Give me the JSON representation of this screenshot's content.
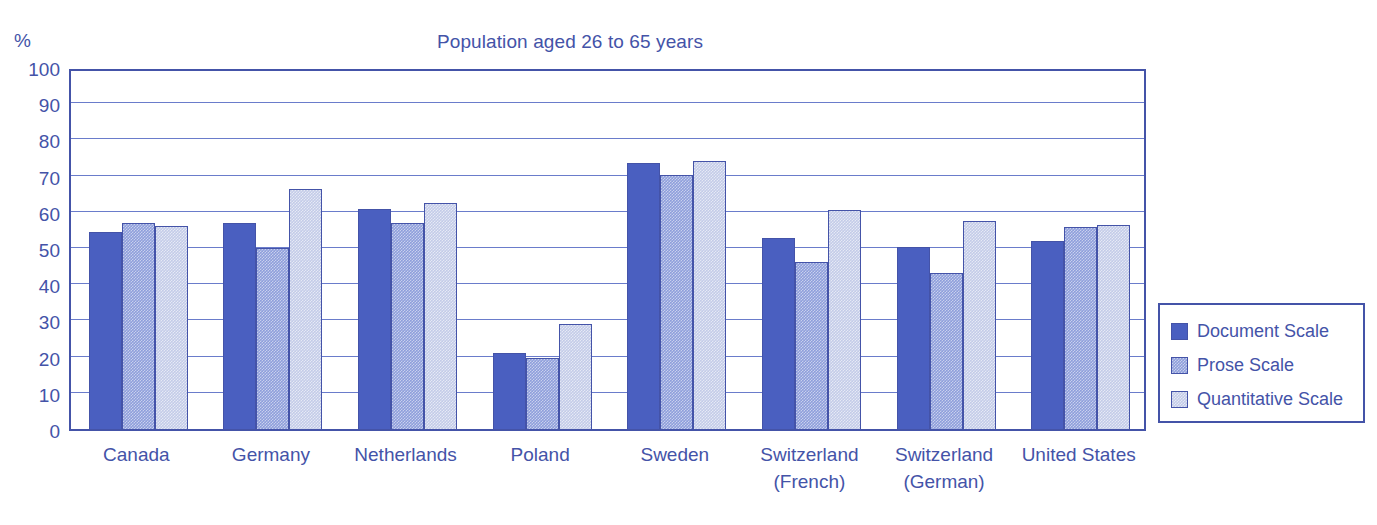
{
  "chart_data": {
    "type": "bar",
    "title": "Population aged 26 to 65 years",
    "xlabel": "",
    "ylabel": "",
    "yunit": "%",
    "ylim": [
      0,
      100
    ],
    "yticks": [
      100,
      90,
      80,
      70,
      60,
      50,
      40,
      30,
      20,
      10,
      0
    ],
    "grid": true,
    "legend_position": "right",
    "categories": [
      "Canada",
      "Germany",
      "Netherlands",
      "Poland",
      "Sweden",
      "Switzerland\n(French)",
      "Switzerland\n(German)",
      "United States"
    ],
    "series": [
      {
        "name": "Document Scale",
        "color": "#4a5fc0",
        "values": [
          54.5,
          57.0,
          60.8,
          21.0,
          73.5,
          52.8,
          50.3,
          52.0
        ]
      },
      {
        "name": "Prose Scale",
        "color": "#8e9edb",
        "values": [
          56.8,
          50.0,
          57.0,
          19.5,
          70.2,
          46.2,
          43.0,
          55.7
        ]
      },
      {
        "name": "Quantitative Scale",
        "color": "#c3cbe8",
        "values": [
          56.2,
          66.2,
          62.3,
          29.0,
          74.0,
          60.6,
          57.5,
          56.4
        ]
      }
    ]
  },
  "axis_color": "#4453a8",
  "grid_color": "#6a7ccb"
}
